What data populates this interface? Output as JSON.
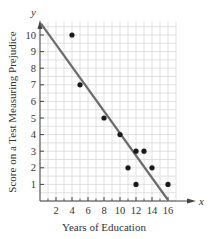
{
  "chart_data": {
    "type": "scatter",
    "title": "",
    "xlabel": "Years of Education",
    "ylabel": "Score on a Test Measuring Prejudice",
    "x_axis_var": "x",
    "y_axis_var": "y",
    "xlim": [
      0,
      17
    ],
    "ylim": [
      0,
      10.8
    ],
    "x_ticks": [
      2,
      4,
      6,
      8,
      10,
      12,
      14,
      16
    ],
    "y_ticks": [
      1,
      2,
      3,
      4,
      5,
      6,
      7,
      8,
      9,
      10
    ],
    "grid": true,
    "points": [
      {
        "x": 4,
        "y": 10
      },
      {
        "x": 5,
        "y": 7
      },
      {
        "x": 8,
        "y": 5
      },
      {
        "x": 10,
        "y": 4
      },
      {
        "x": 11,
        "y": 2
      },
      {
        "x": 12,
        "y": 3
      },
      {
        "x": 12,
        "y": 1
      },
      {
        "x": 13,
        "y": 3
      },
      {
        "x": 14,
        "y": 2
      },
      {
        "x": 16,
        "y": 1
      }
    ],
    "regression_line": {
      "x1": 0,
      "y1": 10.8,
      "x2": 16,
      "y2": 0
    },
    "colors": {
      "points": "#1a1a1a",
      "line": "#6b6b6b",
      "grid": "#d4d4d4",
      "axis": "#444444"
    }
  }
}
